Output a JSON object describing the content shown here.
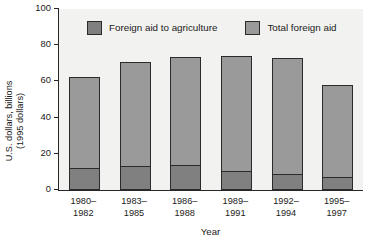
{
  "chart_data": {
    "type": "bar",
    "stacked": true,
    "title": "",
    "xlabel": "Year",
    "ylabel": "U.S. dollars, billions (1995 dollars)",
    "ylabel_line1": "U.S. dollars, billions",
    "ylabel_line2": "(1995 dollars)",
    "categories": [
      "1980–1982",
      "1983–1985",
      "1986–1988",
      "1989–1991",
      "1992–1994",
      "1995–1997"
    ],
    "category_lines": [
      [
        "1980–",
        "1982"
      ],
      [
        "1983–",
        "1985"
      ],
      [
        "1986–",
        "1988"
      ],
      [
        "1989–",
        "1991"
      ],
      [
        "1992–",
        "1994"
      ],
      [
        "1995–",
        "1997"
      ]
    ],
    "series": [
      {
        "name": "Foreign aid to agriculture",
        "color": "#808080",
        "values": [
          12,
          13.5,
          14,
          10.5,
          9,
          7
        ]
      },
      {
        "name": "Total foreign aid",
        "color": "#9a9a9a",
        "values": [
          62.5,
          71,
          73.5,
          74,
          73,
          58
        ]
      }
    ],
    "ylim": [
      0,
      100
    ],
    "yticks": [
      0,
      20,
      40,
      60,
      80,
      100
    ],
    "ytick_labels": [
      "0",
      "20",
      "40",
      "60",
      "80",
      "100"
    ],
    "grid": false,
    "legend_position": "top-inside",
    "plot_background": "#f2f2f0",
    "axis_color": "#262626"
  },
  "legend": {
    "items": [
      {
        "label": "Foreign aid to agriculture",
        "swatch": "agri"
      },
      {
        "label": "Total foreign aid",
        "swatch": "total"
      }
    ]
  }
}
